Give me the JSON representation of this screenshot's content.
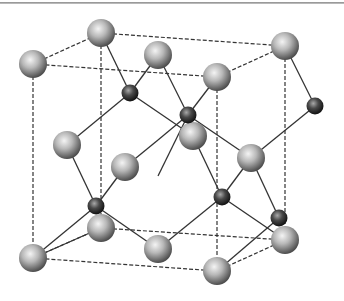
{
  "diagram": {
    "colors": {
      "background": "#ffffff",
      "frame_line": "#333333",
      "bond_line": "#333333",
      "large_atom_light": "#f0f0f0",
      "large_atom_dark": "#5a5a5a",
      "small_atom_light": "#9a9a9a",
      "small_atom_dark": "#1a1a1a"
    },
    "large_atoms": [
      {
        "id": "L1",
        "x": 33,
        "y": 64
      },
      {
        "id": "L2",
        "x": 101,
        "y": 33
      },
      {
        "id": "L3",
        "x": 158,
        "y": 55
      },
      {
        "id": "L4",
        "x": 285,
        "y": 46
      },
      {
        "id": "L5",
        "x": 217,
        "y": 77
      },
      {
        "id": "L6",
        "x": 193,
        "y": 136
      },
      {
        "id": "L7",
        "x": 67,
        "y": 145
      },
      {
        "id": "L8",
        "x": 125,
        "y": 167
      },
      {
        "id": "L9",
        "x": 251,
        "y": 158
      },
      {
        "id": "L10",
        "x": 101,
        "y": 228
      },
      {
        "id": "L11",
        "x": 33,
        "y": 258
      },
      {
        "id": "L12",
        "x": 158,
        "y": 249
      },
      {
        "id": "L13",
        "x": 285,
        "y": 240
      },
      {
        "id": "L14",
        "x": 217,
        "y": 271
      }
    ],
    "small_atoms": [
      {
        "id": "S1",
        "x": 130,
        "y": 93
      },
      {
        "id": "S2",
        "x": 188,
        "y": 115
      },
      {
        "id": "S3",
        "x": 315,
        "y": 106
      },
      {
        "id": "S4",
        "x": 96,
        "y": 206
      },
      {
        "id": "S5",
        "x": 222,
        "y": 197
      },
      {
        "id": "S6",
        "x": 279,
        "y": 218
      }
    ]
  }
}
